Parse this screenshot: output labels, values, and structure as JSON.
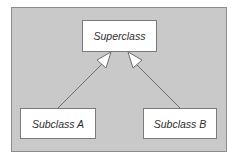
{
  "diagram": {
    "type": "uml-class-inheritance",
    "background_color": "#c9c9c9",
    "nodes": [
      {
        "id": "superclass",
        "label": "Superclass"
      },
      {
        "id": "subclass-a",
        "label": "Subclass A"
      },
      {
        "id": "subclass-b",
        "label": "Subclass B"
      }
    ],
    "edges": [
      {
        "from": "subclass-a",
        "to": "superclass",
        "kind": "generalization",
        "arrowhead": "hollow-triangle"
      },
      {
        "from": "subclass-b",
        "to": "superclass",
        "kind": "generalization",
        "arrowhead": "hollow-triangle"
      }
    ]
  }
}
